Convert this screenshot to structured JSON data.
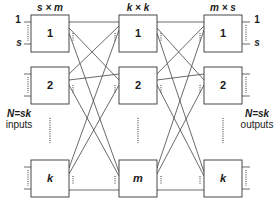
{
  "diagram": {
    "stages": [
      {
        "label": "s × m",
        "boxes": [
          "1",
          "2",
          "k"
        ]
      },
      {
        "label": "k × k",
        "boxes": [
          "1",
          "2",
          "m"
        ]
      },
      {
        "label": "m × s",
        "boxes": [
          "1",
          "2",
          "k"
        ]
      }
    ],
    "input_labels": {
      "first": "1",
      "last": "s"
    },
    "output_labels": {
      "first": "1",
      "last": "s"
    },
    "left_side": {
      "line1": "N=sk",
      "line2": "inputs"
    },
    "right_side": {
      "line1": "N=sk",
      "line2": "outputs"
    },
    "colors": {
      "line": "#333333",
      "box_fill": "#ffffff",
      "text": "#1a1a1a"
    }
  }
}
